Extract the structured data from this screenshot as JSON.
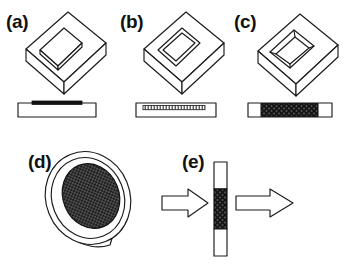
{
  "figure": {
    "background_color": "#ffffff",
    "line_color": "#1a1a1a",
    "fill_color": "#ffffff",
    "hatch_color": "#3a3a3a",
    "solid_color": "#111111",
    "panel_count": 5,
    "rows": 2
  },
  "panels": [
    {
      "id": "a",
      "label": "(a)",
      "view_3d": "tilted rectangular slab with raised rounded rectangular pad on top face",
      "top_feature": "raised-pad",
      "cross_section": "white rectangular substrate with thin solid black layer on top surface",
      "section_fill": "solid-black",
      "section_extent": "partial-width"
    },
    {
      "id": "b",
      "label": "(b)",
      "view_3d": "tilted rectangular slab with flat outlined rectangular window on top face",
      "top_feature": "outlined-window",
      "cross_section": "white rectangular substrate with thin hatched layer inset near top surface",
      "section_fill": "fine-hatch",
      "section_extent": "partial-width"
    },
    {
      "id": "c",
      "label": "(c)",
      "view_3d": "tilted rectangular slab with recessed cavity showing interior walls",
      "top_feature": "recessed-cavity",
      "cross_section": "rectangle with white ends and dark cross-hatched full-height central region",
      "section_fill": "cross-hatch",
      "section_extent": "central-band"
    },
    {
      "id": "d",
      "label": "(d)",
      "view_3d": "tilted circular disc with rim thickness and dark textured inner ellipse",
      "top_feature": "textured-disc",
      "cross_section": null,
      "section_fill": "dot-texture",
      "section_extent": "inner-ellipse"
    },
    {
      "id": "e",
      "label": "(e)",
      "view_3d": "vertical cross-section strip between two hollow block arrows pointing right",
      "top_feature": "vertical-strip",
      "cross_section": "white top segment, dark hatched middle segment, white bottom segment",
      "section_fill": "cross-hatch",
      "section_extent": "central-band",
      "arrows": [
        {
          "name": "inlet-flow-arrow",
          "direction": "right",
          "position": "left-of-strip"
        },
        {
          "name": "outlet-flow-arrow",
          "direction": "right",
          "position": "right-of-strip"
        }
      ]
    }
  ]
}
